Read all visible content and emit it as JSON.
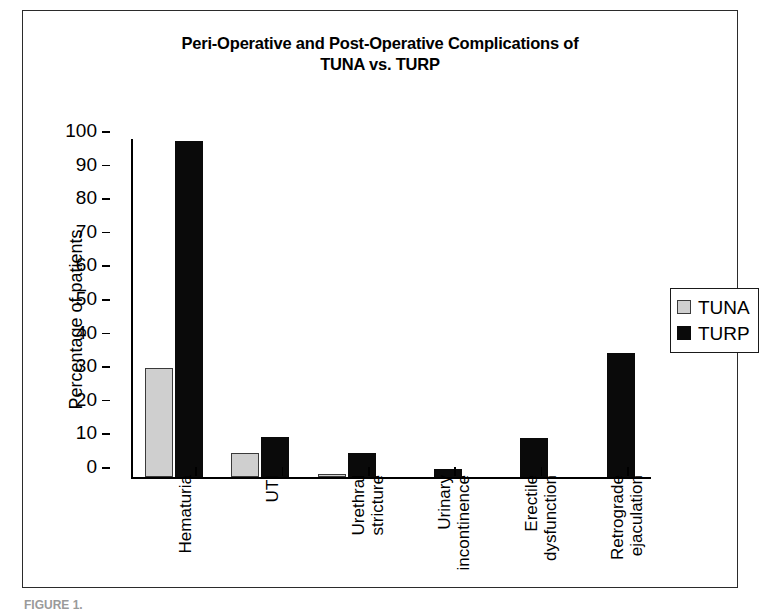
{
  "figure": {
    "caption": "FIGURE 1."
  },
  "chart_data": {
    "type": "bar",
    "title": "Peri-Operative and Post-Operative Complications of TUNA vs. TURP",
    "title_lines": [
      "Peri-Operative and Post-Operative Complications of",
      "TUNA vs. TURP"
    ],
    "xlabel": "",
    "ylabel": "Percentage of patients",
    "ylim": [
      0,
      100
    ],
    "ytick_labels": [
      "100",
      "90",
      "80",
      "70",
      "60",
      "50",
      "40",
      "30",
      "20",
      "10",
      "0"
    ],
    "ytick_values": [
      100,
      90,
      80,
      70,
      60,
      50,
      40,
      30,
      20,
      10,
      0
    ],
    "grid": false,
    "legend_position": "right",
    "categories": [
      "Hematuria",
      "UTI",
      "Urethral\nstricture",
      "Urinary\nincontinence",
      "Erectile\ndysfunction",
      "Retrograde\nejaculation"
    ],
    "series": [
      {
        "name": "TUNA",
        "color": "#cfcfcf",
        "values": [
          32.5,
          7,
          1,
          0,
          0,
          0
        ]
      },
      {
        "name": "TURP",
        "color": "#0a0a0a",
        "values": [
          100,
          12,
          7,
          2.5,
          11.5,
          37
        ]
      }
    ]
  },
  "legend": {
    "items": [
      {
        "label": "TUNA",
        "swatch": "tuna"
      },
      {
        "label": "TURP",
        "swatch": "turp"
      }
    ]
  }
}
